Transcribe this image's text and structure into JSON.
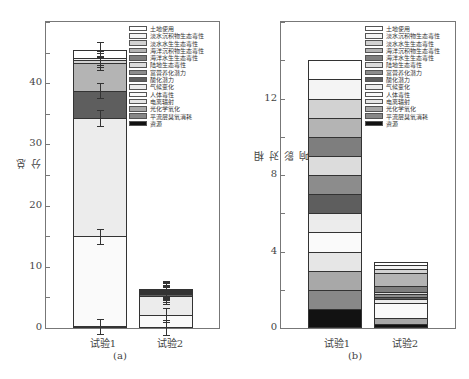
{
  "legend": [
    "土地使用",
    "淡水沉积物生态毒性",
    "淡水水生生态毒性",
    "海洋沉积物生态毒性",
    "海洋水生生态毒性",
    "陆地生态毒性",
    "富营养化潜力",
    "酸化潜力",
    "气候变化",
    "人体毒性",
    "电离辐射",
    "光化学氧化",
    "平流层臭氧消耗",
    "资源"
  ],
  "legend_colors": [
    "#ffffff",
    "#f4f4f4",
    "#d2d2d2",
    "#b4b4b4",
    "#7e7e7e",
    "#dcdcdc",
    "#8c8c8c",
    "#5e5e5e",
    "#ececec",
    "#fafafa",
    "#e6e6e6",
    "#a8a8a8",
    "#888888",
    "#121212"
  ],
  "panel_a": {
    "caption": "(a)",
    "ylabel": "总分",
    "yticks": [
      "0",
      "10",
      "20",
      "30",
      "40"
    ],
    "categories": [
      "试验1",
      "试验2"
    ]
  },
  "panel_b": {
    "caption": "(b)",
    "ylabel": "相对影响",
    "yticks": [
      "0",
      "4",
      "8",
      "12"
    ],
    "categories": [
      "试验1",
      "试验2"
    ]
  },
  "chart_data": [
    {
      "type": "bar",
      "stacked": true,
      "title": "(a)",
      "xlabel": "",
      "ylabel": "总分",
      "ylim": [
        0,
        50
      ],
      "yticks": [
        0,
        10,
        20,
        30,
        40
      ],
      "categories": [
        "试验1",
        "试验2"
      ],
      "series": [
        {
          "name": "资源",
          "values": [
            0.3,
            0.1
          ]
        },
        {
          "name": "平流层臭氧消耗",
          "values": [
            0.0,
            0.0
          ]
        },
        {
          "name": "光化学氧化",
          "values": [
            0.0,
            0.0
          ]
        },
        {
          "name": "电离辐射",
          "values": [
            0.0,
            0.0
          ]
        },
        {
          "name": "人体毒性",
          "values": [
            14.7,
            2.0
          ]
        },
        {
          "name": "气候变化",
          "values": [
            19.3,
            3.1
          ]
        },
        {
          "name": "酸化潜力",
          "values": [
            4.5,
            0.3
          ]
        },
        {
          "name": "富营养化潜力",
          "values": [
            0.0,
            0.2
          ]
        },
        {
          "name": "陆地生态毒性",
          "values": [
            0.0,
            0.0
          ]
        },
        {
          "name": "海洋水生生态毒性",
          "values": [
            0.0,
            0.2
          ]
        },
        {
          "name": "海洋沉积物生态毒性",
          "values": [
            4.5,
            0.2
          ]
        },
        {
          "name": "淡水水生生态毒性",
          "values": [
            0.5,
            0.1
          ]
        },
        {
          "name": "淡水沉积物生态毒性",
          "values": [
            0.3,
            0.1
          ]
        },
        {
          "name": "土地使用",
          "values": [
            1.4,
            0.1
          ]
        }
      ],
      "totals": [
        45.5,
        6.3
      ],
      "error_bars": "present on segment tops",
      "legend_position": "upper right inside"
    },
    {
      "type": "bar",
      "stacked": true,
      "title": "(b)",
      "xlabel": "",
      "ylabel": "相对影响",
      "ylim": [
        0,
        16
      ],
      "yticks": [
        0,
        4,
        8,
        12
      ],
      "categories": [
        "试验1",
        "试验2"
      ],
      "series": [
        {
          "name": "资源",
          "values": [
            1.0,
            0.2
          ]
        },
        {
          "name": "平流层臭氧消耗",
          "values": [
            1.0,
            0.0
          ]
        },
        {
          "name": "光化学氧化",
          "values": [
            1.0,
            0.3
          ]
        },
        {
          "name": "电离辐射",
          "values": [
            1.0,
            0.0
          ]
        },
        {
          "name": "人体毒性",
          "values": [
            1.0,
            0.8
          ]
        },
        {
          "name": "气候变化",
          "values": [
            1.0,
            0.2
          ]
        },
        {
          "name": "酸化潜力",
          "values": [
            1.0,
            0.1
          ]
        },
        {
          "name": "富营养化潜力",
          "values": [
            1.0,
            0.2
          ]
        },
        {
          "name": "陆地生态毒性",
          "values": [
            1.0,
            0.1
          ]
        },
        {
          "name": "海洋水生生态毒性",
          "values": [
            1.0,
            0.3
          ]
        },
        {
          "name": "海洋沉积物生态毒性",
          "values": [
            1.0,
            0.7
          ]
        },
        {
          "name": "淡水水生生态毒性",
          "values": [
            1.0,
            0.2
          ]
        },
        {
          "name": "淡水沉积物生态毒性",
          "values": [
            1.0,
            0.2
          ]
        },
        {
          "name": "土地使用",
          "values": [
            1.0,
            0.15
          ]
        }
      ],
      "totals": [
        14.0,
        3.45
      ],
      "legend_position": "upper right inside"
    }
  ]
}
